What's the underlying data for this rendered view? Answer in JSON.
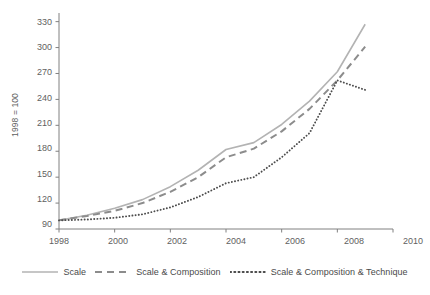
{
  "chart_data": {
    "type": "line",
    "title": "",
    "xlabel": "",
    "ylabel": "1998 = 100",
    "xlim": [
      1998,
      2010
    ],
    "ylim": [
      90,
      340
    ],
    "grid": false,
    "legend_position": "bottom",
    "xticks": [
      "1998",
      "2000",
      "2002",
      "2004",
      "2006",
      "2008",
      "2010"
    ],
    "xtick_values": [
      1998,
      2000,
      2002,
      2004,
      2006,
      2008,
      2010
    ],
    "yticks": [
      "90",
      "120",
      "150",
      "180",
      "210",
      "240",
      "270",
      "300",
      "330"
    ],
    "ytick_values": [
      90,
      120,
      150,
      180,
      210,
      240,
      270,
      300,
      330
    ],
    "x": [
      1998,
      1999,
      2000,
      2001,
      2002,
      2003,
      2004,
      2005,
      2006,
      2007,
      2008,
      2009
    ],
    "series": [
      {
        "name": "Scale",
        "style": "solid",
        "color": "#b3b3b3",
        "values": [
          100,
          106,
          114,
          124,
          139,
          158,
          182,
          190,
          211,
          238,
          272,
          327
        ]
      },
      {
        "name": "Scale & Composition",
        "style": "dashed",
        "color": "#8c8c8c",
        "values": [
          100,
          105,
          111,
          120,
          133,
          150,
          173,
          183,
          203,
          229,
          262,
          301
        ]
      },
      {
        "name": "Scale & Composition & Technique",
        "style": "dotted",
        "color": "#4d4d4d",
        "values": [
          100,
          101,
          103,
          107,
          115,
          127,
          143,
          150,
          173,
          201,
          262,
          251
        ]
      }
    ]
  },
  "axis": {
    "ylabel": "1998 = 100",
    "axis_color": "#808080"
  },
  "legend": {
    "items": [
      {
        "label": "Scale",
        "style": "solid",
        "color": "#b3b3b3"
      },
      {
        "label": "Scale & Composition",
        "style": "dashed",
        "color": "#8c8c8c"
      },
      {
        "label": "Scale & Composition & Technique",
        "style": "dotted",
        "color": "#4d4d4d"
      }
    ]
  }
}
